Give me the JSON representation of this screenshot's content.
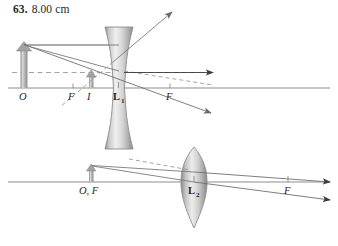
{
  "answer": {
    "number": "63.",
    "value": "8.00 cm"
  },
  "figure": {
    "colors": {
      "axis": "#8d8d8d",
      "ray": "#7a7a7a",
      "ray_dark": "#4a4a4a",
      "dashed": "#9a9a9a",
      "lens_fill": "#bdbdbd",
      "lens_edge": "#8a8a8a",
      "object_fill": "#a8a8a8",
      "text": "#1f1f1f"
    },
    "panels": [
      {
        "name": "diverging-lens-panel",
        "lens_type": "diverging",
        "lens_label": "L",
        "lens_label_sub": "1",
        "axis_label": "principal-axis",
        "labels": [
          {
            "name": "object-point-label",
            "text": "O"
          },
          {
            "name": "near-focal-point-label",
            "text": "F"
          },
          {
            "name": "image-point-label",
            "text": "I"
          },
          {
            "name": "far-focal-point-label",
            "text": "F"
          }
        ],
        "objects": [
          {
            "name": "object-arrow",
            "desc": "upright object arrow at O"
          },
          {
            "name": "image-arrow",
            "desc": "small upright image arrow at I"
          }
        ],
        "rays": [
          {
            "name": "parallel-incident-ray",
            "style": "solid"
          },
          {
            "name": "diverged-outgoing-ray",
            "style": "solid"
          },
          {
            "name": "virtual-backward-extension-ray",
            "style": "dashed"
          },
          {
            "name": "through-center-ray",
            "style": "solid"
          },
          {
            "name": "axis-ray",
            "style": "solid"
          },
          {
            "name": "extended-ray-up-right",
            "style": "solid"
          }
        ]
      },
      {
        "name": "converging-lens-panel",
        "lens_type": "converging",
        "lens_label": "L",
        "lens_label_sub": "2",
        "axis_label": "principal-axis",
        "labels": [
          {
            "name": "object-focal-point-label",
            "text": "O, F"
          },
          {
            "name": "image-focal-point-label",
            "text": "F"
          }
        ],
        "objects": [
          {
            "name": "object-arrow",
            "desc": "small upright object arrow at O, F"
          }
        ],
        "rays": [
          {
            "name": "upper-incident-ray",
            "style": "solid"
          },
          {
            "name": "lower-outgoing-ray",
            "style": "solid"
          },
          {
            "name": "refracted-parallel-ray",
            "style": "solid"
          },
          {
            "name": "virtual-extension-ray",
            "style": "dashed"
          }
        ]
      }
    ]
  }
}
